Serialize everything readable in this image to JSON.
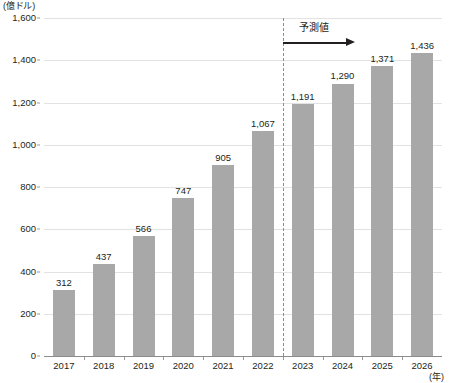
{
  "chart_data": {
    "type": "bar",
    "title": "",
    "subtitle": "",
    "xlabel": "(年)",
    "ylabel": "(億ドル)",
    "categories": [
      "2017",
      "2018",
      "2019",
      "2020",
      "2021",
      "2022",
      "2023",
      "2024",
      "2025",
      "2026"
    ],
    "values": [
      312,
      437,
      566,
      747,
      905,
      1067,
      1191,
      1290,
      1371,
      1436
    ],
    "value_labels": [
      "312",
      "437",
      "566",
      "747",
      "905",
      "1,067",
      "1,191",
      "1,290",
      "1,371",
      "1,436"
    ],
    "ylim": [
      0,
      1600
    ],
    "ytick_values": [
      0,
      200,
      400,
      600,
      800,
      1000,
      1200,
      1400,
      1600
    ],
    "ytick_labels": [
      "0",
      "200",
      "400",
      "600",
      "800",
      "1,000",
      "1,200",
      "1,400",
      "1,600"
    ],
    "grid": true,
    "legend": false,
    "series": [
      {
        "name": "",
        "values": [
          312,
          437,
          566,
          747,
          905,
          1067,
          1191,
          1290,
          1371,
          1436
        ],
        "color": "#a8a8a8"
      }
    ],
    "annotations": [
      {
        "name": "forecast",
        "label": "予測値",
        "starts_at_category": "2023",
        "ends_at_category": "2026",
        "marker": "dashed-vertical-divider-with-arrow"
      }
    ],
    "colors": {
      "bar": "#a8a8a8",
      "gridline": "#e2e2e2",
      "axis": "#8c8c8c",
      "text": "#231f20"
    }
  }
}
